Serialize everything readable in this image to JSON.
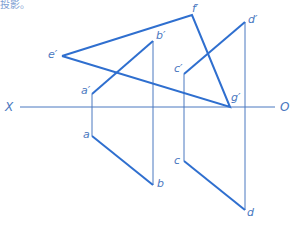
{
  "header_fragment": "投影。",
  "axis": {
    "left_label": "X",
    "right_label": "O",
    "y": 107,
    "x_start": 20,
    "x_end": 275
  },
  "colors": {
    "thick_line": "#2f6fcf",
    "thin_line": "#4a78c0",
    "label": "#4a78c0"
  },
  "points": {
    "e_prime": {
      "label": "e′",
      "x": 62,
      "y": 56
    },
    "f_prime": {
      "label": "f′",
      "x": 192,
      "y": 15
    },
    "g_prime": {
      "label": "g′",
      "x": 230,
      "y": 107
    },
    "a_prime": {
      "label": "a′",
      "x": 92,
      "y": 94
    },
    "b_prime": {
      "label": "b′",
      "x": 153,
      "y": 41
    },
    "c_prime": {
      "label": "c′",
      "x": 184,
      "y": 74
    },
    "d_prime": {
      "label": "d′",
      "x": 245,
      "y": 22
    },
    "a": {
      "label": "a",
      "x": 92,
      "y": 136
    },
    "b": {
      "label": "b",
      "x": 153,
      "y": 185
    },
    "c": {
      "label": "c",
      "x": 184,
      "y": 161
    },
    "d": {
      "label": "d",
      "x": 245,
      "y": 210
    }
  },
  "segments": {
    "triangle_efg": [
      "e_prime-f_prime",
      "f_prime-g_prime",
      "g_prime-e_prime"
    ],
    "line_ab_front": "a_prime-b_prime",
    "line_ab_top": "a-b",
    "line_cd_front": "c_prime-d_prime",
    "line_cd_top": "c-d",
    "projection_links": [
      "a_prime-a",
      "b_prime-b",
      "c_prime-c",
      "d_prime-d"
    ]
  }
}
